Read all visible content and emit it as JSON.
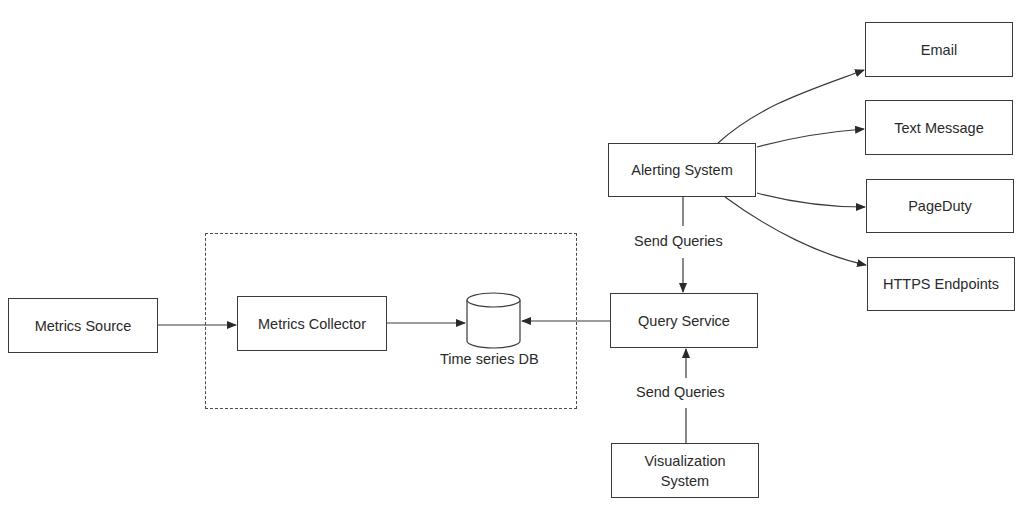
{
  "diagram": {
    "group": {
      "name": "metrics-collection-group",
      "style": "dashed"
    },
    "nodes": {
      "metrics_source": "Metrics Source",
      "metrics_collector": "Metrics Collector",
      "time_series_db": "Time series DB",
      "query_service": "Query Service",
      "alerting_system": "Alerting System",
      "visualization_system": "Visualization System",
      "email": "Email",
      "text_message": "Text Message",
      "pageduty": "PageDuty",
      "https_endpoints": "HTTPS Endpoints"
    },
    "edge_labels": {
      "alerting_to_query": "Send Queries",
      "visualization_to_query": "Send Queries"
    },
    "edges": [
      {
        "from": "Metrics Source",
        "to": "Metrics Collector"
      },
      {
        "from": "Metrics Collector",
        "to": "Time series DB"
      },
      {
        "from": "Query Service",
        "to": "Time series DB"
      },
      {
        "from": "Alerting System",
        "to": "Query Service",
        "label": "Send Queries"
      },
      {
        "from": "Visualization System",
        "to": "Query Service",
        "label": "Send Queries"
      },
      {
        "from": "Alerting System",
        "to": "Email"
      },
      {
        "from": "Alerting System",
        "to": "Text Message"
      },
      {
        "from": "Alerting System",
        "to": "PageDuty"
      },
      {
        "from": "Alerting System",
        "to": "HTTPS Endpoints"
      }
    ],
    "colors": {
      "stroke": "#3a3a3a",
      "text": "#2a2a2a",
      "background": "#ffffff"
    }
  }
}
